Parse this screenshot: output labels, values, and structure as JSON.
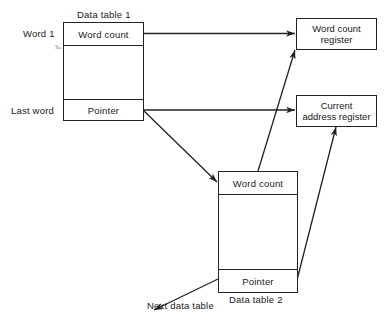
{
  "diagram": {
    "data_table_1": {
      "title": "Data table 1",
      "row_labels": {
        "first": "Word 1",
        "last": "Last word"
      },
      "cells": {
        "word_count": "Word count",
        "pointer": "Pointer"
      }
    },
    "data_table_2": {
      "title": "Data table 2",
      "cells": {
        "word_count": "Word count",
        "pointer": "Pointer"
      }
    },
    "word_count_register": {
      "line1": "Word count",
      "line2": "register"
    },
    "current_address_register": {
      "line1": "Current",
      "line2": "address register"
    },
    "next_data_table": "Next data table",
    "stray_mark": "‰"
  },
  "colors": {
    "line": "#222222",
    "text": "#1a1a1a",
    "background": "#ffffff"
  },
  "edges": [
    {
      "from": "data_table_1.word_count",
      "to": "word_count_register"
    },
    {
      "from": "data_table_1.pointer",
      "to": "current_address_register"
    },
    {
      "from": "data_table_1.pointer",
      "to": "data_table_2.word_count"
    },
    {
      "from": "data_table_2.word_count",
      "to": "word_count_register"
    },
    {
      "from": "data_table_2.pointer",
      "to": "current_address_register"
    },
    {
      "from": "data_table_2.pointer",
      "to": "next_data_table"
    }
  ]
}
